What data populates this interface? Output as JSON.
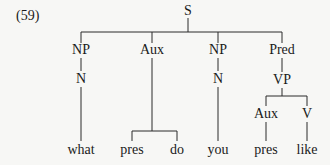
{
  "example_number": "(59)",
  "tree": {
    "root": "S",
    "nodes": {
      "S": "S",
      "np1": "NP",
      "n1": "N",
      "aux1": "Aux",
      "np2": "NP",
      "n2": "N",
      "pred": "Pred",
      "vp": "VP",
      "aux2": "Aux",
      "v": "V"
    },
    "leaves": {
      "what": "what",
      "pres1": "pres",
      "do": "do",
      "you": "you",
      "pres2": "pres",
      "like": "like"
    }
  }
}
